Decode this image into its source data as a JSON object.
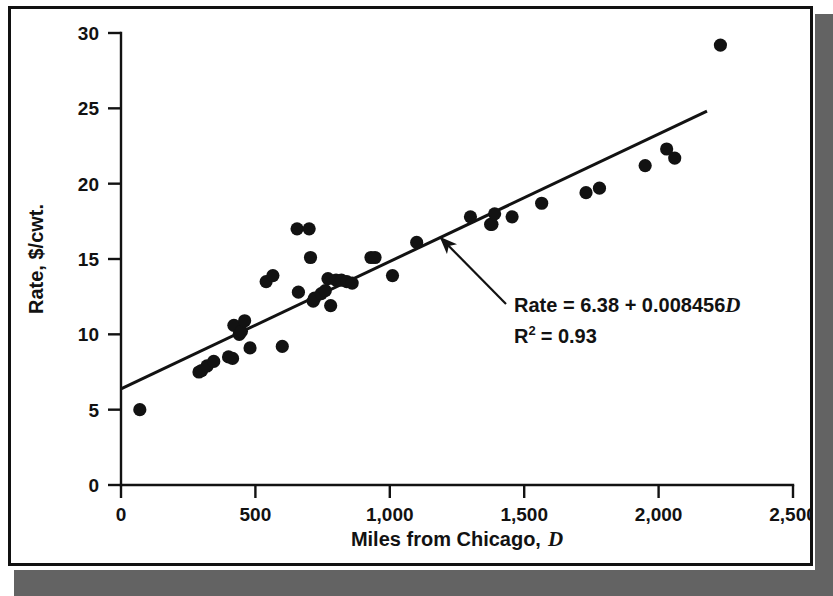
{
  "figure": {
    "background_color": "#ffffff",
    "frame_color": "#111111",
    "shadow_color": "#636363",
    "ink_color": "#121212"
  },
  "annotation": {
    "equation_prefix": "Rate = 6.38 + 0.008456",
    "equation_variable": "D",
    "r2_label": "R",
    "r2_exponent": "2",
    "r2_value": "= 0.93"
  },
  "axes": {
    "x_title_text": "Miles from Chicago,",
    "x_title_variable": "D",
    "y_title": "Rate, $/cwt.",
    "x_ticks": [
      "0",
      "500",
      "1,000",
      "1,500",
      "2,000",
      "2,500"
    ],
    "y_ticks": [
      "0",
      "5",
      "10",
      "15",
      "20",
      "25",
      "30"
    ]
  },
  "chart_data": {
    "type": "scatter",
    "title": "",
    "xlabel": "Miles from Chicago, D",
    "ylabel": "Rate, $/cwt.",
    "xlim": [
      0,
      2500
    ],
    "ylim": [
      0,
      30
    ],
    "x_tick_values": [
      0,
      500,
      1000,
      1500,
      2000,
      2500
    ],
    "y_tick_values": [
      0,
      5,
      10,
      15,
      20,
      25,
      30
    ],
    "grid": false,
    "legend": false,
    "marker": "filled-circle",
    "marker_color": "#121212",
    "marker_size": 9,
    "points": [
      [
        70,
        5.0
      ],
      [
        290,
        7.5
      ],
      [
        300,
        7.6
      ],
      [
        320,
        7.9
      ],
      [
        345,
        8.2
      ],
      [
        400,
        8.5
      ],
      [
        415,
        8.4
      ],
      [
        420,
        10.6
      ],
      [
        440,
        10.0
      ],
      [
        448,
        10.2
      ],
      [
        460,
        10.9
      ],
      [
        480,
        9.1
      ],
      [
        540,
        13.5
      ],
      [
        565,
        13.9
      ],
      [
        600,
        9.2
      ],
      [
        655,
        17.0
      ],
      [
        660,
        12.8
      ],
      [
        700,
        17.0
      ],
      [
        705,
        15.1
      ],
      [
        715,
        12.2
      ],
      [
        720,
        12.4
      ],
      [
        745,
        12.7
      ],
      [
        760,
        12.9
      ],
      [
        770,
        13.7
      ],
      [
        780,
        11.9
      ],
      [
        800,
        13.6
      ],
      [
        820,
        13.6
      ],
      [
        840,
        13.5
      ],
      [
        860,
        13.4
      ],
      [
        930,
        15.1
      ],
      [
        945,
        15.1
      ],
      [
        1010,
        13.9
      ],
      [
        1100,
        16.1
      ],
      [
        1300,
        17.8
      ],
      [
        1375,
        17.3
      ],
      [
        1380,
        17.3
      ],
      [
        1390,
        18.0
      ],
      [
        1455,
        17.8
      ],
      [
        1565,
        18.7
      ],
      [
        1730,
        19.4
      ],
      [
        1780,
        19.7
      ],
      [
        1950,
        21.2
      ],
      [
        2030,
        22.3
      ],
      [
        2060,
        21.7
      ],
      [
        2230,
        29.2
      ]
    ],
    "fit_line": {
      "label": "Rate = 6.38 + 0.008456D",
      "intercept": 6.38,
      "slope": 0.008456,
      "r_squared": 0.93,
      "x_start": 0,
      "x_end": 2180,
      "color": "#121212"
    },
    "annotations": [
      {
        "text": "Rate = 6.38 + 0.008456D",
        "points_to_x": 1190,
        "points_to_y": 16.4
      },
      {
        "text": "R2 = 0.93"
      }
    ]
  }
}
